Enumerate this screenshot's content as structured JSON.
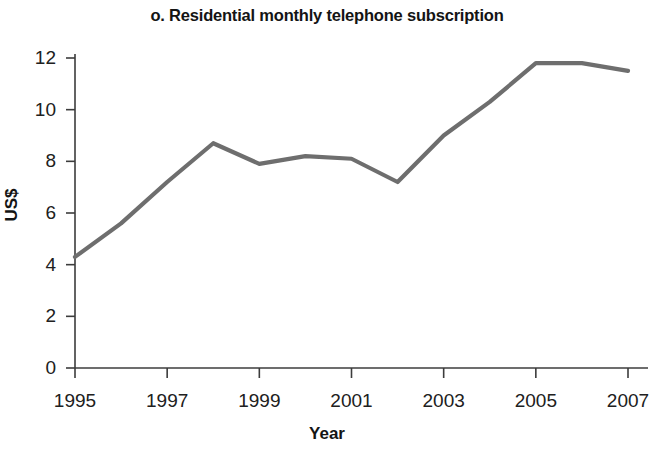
{
  "chart_data": {
    "type": "line",
    "title": "o. Residential monthly telephone subscription",
    "xlabel": "Year",
    "ylabel": "US$",
    "x": [
      1995,
      1996,
      1997,
      1998,
      1999,
      2000,
      2001,
      2002,
      2003,
      2004,
      2005,
      2006,
      2007
    ],
    "values": [
      4.3,
      5.6,
      7.2,
      8.7,
      7.9,
      8.2,
      8.1,
      7.2,
      9.0,
      10.3,
      11.8,
      11.8,
      11.5
    ],
    "series": [
      {
        "name": "Residential monthly telephone subscription",
        "values": [
          4.3,
          5.6,
          7.2,
          8.7,
          7.9,
          8.2,
          8.1,
          7.2,
          9.0,
          10.3,
          11.8,
          11.8,
          11.5
        ]
      }
    ],
    "xlim": [
      1995,
      2007
    ],
    "ylim": [
      0,
      12
    ],
    "xtick_labels": [
      "1995",
      "1997",
      "1999",
      "2001",
      "2003",
      "2005",
      "2007"
    ],
    "xticks": [
      1995,
      1997,
      1999,
      2001,
      2003,
      2005,
      2007
    ],
    "ytick_labels": [
      "0",
      "2",
      "4",
      "6",
      "8",
      "10",
      "12"
    ],
    "yticks": [
      0,
      2,
      4,
      6,
      8,
      10,
      12
    ],
    "grid": false,
    "legend": "none",
    "line_color": "#6e6e6e",
    "axis_color": "#3c3c3c"
  }
}
